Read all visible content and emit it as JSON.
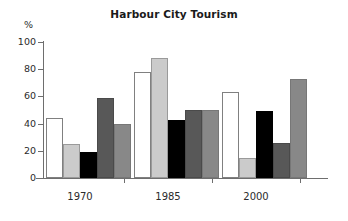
{
  "chart_data": {
    "type": "bar",
    "title": "Harbour City Tourism",
    "xlabel": "",
    "ylabel": "%",
    "ylim": [
      0,
      100
    ],
    "yticks": [
      0,
      20,
      40,
      60,
      80,
      100
    ],
    "grid": false,
    "legend": "none",
    "categories": [
      "1970",
      "1985",
      "2000"
    ],
    "series": [
      {
        "name": "Series 1",
        "color": "#ffffff",
        "values": [
          44,
          78,
          63
        ]
      },
      {
        "name": "Series 2",
        "color": "#cbcbcb",
        "values": [
          25,
          88,
          15
        ]
      },
      {
        "name": "Series 3",
        "color": "#000000",
        "values": [
          19,
          43,
          49
        ]
      },
      {
        "name": "Series 4",
        "color": "#585858",
        "values": [
          59,
          50,
          26
        ]
      },
      {
        "name": "Series 5",
        "color": "#888888",
        "values": [
          40,
          50,
          73
        ]
      }
    ]
  },
  "axis": {
    "y_unit": "%",
    "y_tick_labels": [
      "100",
      "80",
      "60",
      "40",
      "20",
      "0"
    ],
    "x_tick_labels": [
      "1970",
      "1985",
      "2000"
    ]
  },
  "colors": {
    "axis": "#6e6e6e",
    "text": "#2b2b2b",
    "title": "#1a1a1a",
    "background": "#ffffff"
  }
}
